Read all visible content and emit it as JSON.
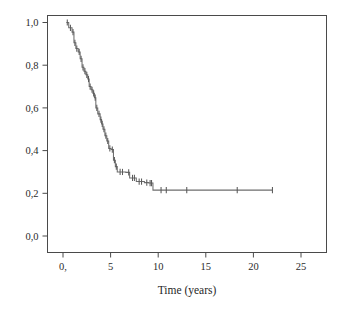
{
  "chart_data": {
    "type": "line",
    "subtype": "kaplan-meier-survival-step",
    "title": "",
    "subtitle": "",
    "xlabel": "Time (years)",
    "ylabel": "",
    "xlim": [
      -1.3,
      27.8
    ],
    "ylim": [
      -0.06,
      1.07
    ],
    "grid": false,
    "legend": null,
    "x_tick_labels": [
      "0,",
      "5",
      "10",
      "15",
      "20",
      "25"
    ],
    "x_tick_values": [
      0,
      5,
      10,
      15,
      20,
      25
    ],
    "y_tick_labels": [
      "0,0",
      "0,2",
      "0,4",
      "0,6",
      "0,8",
      "1,0"
    ],
    "y_tick_values": [
      0.0,
      0.2,
      0.4,
      0.6,
      0.8,
      1.0
    ],
    "line_color": "#6d6d6d",
    "frame_color": "#4a4a4a",
    "background_color": "#ffffff",
    "series": [
      {
        "name": "survival",
        "step_points": [
          [
            0.35,
            1.0
          ],
          [
            0.6,
            1.0
          ],
          [
            0.6,
            0.975
          ],
          [
            0.95,
            0.975
          ],
          [
            0.95,
            0.955
          ],
          [
            1.15,
            0.955
          ],
          [
            1.15,
            0.905
          ],
          [
            1.35,
            0.905
          ],
          [
            1.35,
            0.878
          ],
          [
            1.6,
            0.878
          ],
          [
            1.6,
            0.862
          ],
          [
            1.8,
            0.862
          ],
          [
            1.8,
            0.83
          ],
          [
            2.0,
            0.83
          ],
          [
            2.0,
            0.79
          ],
          [
            2.2,
            0.79
          ],
          [
            2.2,
            0.772
          ],
          [
            2.4,
            0.772
          ],
          [
            2.4,
            0.755
          ],
          [
            2.6,
            0.755
          ],
          [
            2.6,
            0.735
          ],
          [
            2.75,
            0.735
          ],
          [
            2.75,
            0.7
          ],
          [
            2.95,
            0.7
          ],
          [
            2.95,
            0.685
          ],
          [
            3.15,
            0.685
          ],
          [
            3.15,
            0.668
          ],
          [
            3.3,
            0.668
          ],
          [
            3.3,
            0.648
          ],
          [
            3.45,
            0.648
          ],
          [
            3.45,
            0.6
          ],
          [
            3.65,
            0.6
          ],
          [
            3.65,
            0.572
          ],
          [
            3.9,
            0.572
          ],
          [
            3.9,
            0.545
          ],
          [
            4.05,
            0.545
          ],
          [
            4.05,
            0.525
          ],
          [
            4.2,
            0.525
          ],
          [
            4.2,
            0.5
          ],
          [
            4.4,
            0.5
          ],
          [
            4.4,
            0.47
          ],
          [
            4.6,
            0.47
          ],
          [
            4.6,
            0.445
          ],
          [
            4.8,
            0.445
          ],
          [
            4.8,
            0.41
          ],
          [
            5.05,
            0.41
          ],
          [
            5.05,
            0.405
          ],
          [
            5.3,
            0.405
          ],
          [
            5.3,
            0.355
          ],
          [
            5.5,
            0.355
          ],
          [
            5.5,
            0.325
          ],
          [
            5.7,
            0.325
          ],
          [
            5.7,
            0.3
          ],
          [
            6.6,
            0.3
          ],
          [
            6.6,
            0.298
          ],
          [
            7.0,
            0.298
          ],
          [
            7.0,
            0.272
          ],
          [
            7.7,
            0.272
          ],
          [
            7.7,
            0.255
          ],
          [
            8.55,
            0.255
          ],
          [
            8.55,
            0.25
          ],
          [
            9.0,
            0.25
          ],
          [
            9.0,
            0.248
          ],
          [
            9.45,
            0.248
          ],
          [
            9.45,
            0.215
          ],
          [
            22.0,
            0.215
          ]
        ],
        "censored_points": [
          [
            0.45,
            1.0
          ],
          [
            0.78,
            0.975
          ],
          [
            1.05,
            0.955
          ],
          [
            1.25,
            0.905
          ],
          [
            1.45,
            0.878
          ],
          [
            1.7,
            0.862
          ],
          [
            1.9,
            0.83
          ],
          [
            2.1,
            0.79
          ],
          [
            2.3,
            0.772
          ],
          [
            2.5,
            0.755
          ],
          [
            2.68,
            0.735
          ],
          [
            2.85,
            0.7
          ],
          [
            3.05,
            0.685
          ],
          [
            3.22,
            0.668
          ],
          [
            3.38,
            0.648
          ],
          [
            3.55,
            0.6
          ],
          [
            3.78,
            0.572
          ],
          [
            3.98,
            0.545
          ],
          [
            4.12,
            0.525
          ],
          [
            4.3,
            0.5
          ],
          [
            4.5,
            0.47
          ],
          [
            4.7,
            0.445
          ],
          [
            4.92,
            0.41
          ],
          [
            5.18,
            0.405
          ],
          [
            5.4,
            0.355
          ],
          [
            5.6,
            0.325
          ],
          [
            6.0,
            0.3
          ],
          [
            6.25,
            0.3
          ],
          [
            6.9,
            0.298
          ],
          [
            7.3,
            0.272
          ],
          [
            7.5,
            0.272
          ],
          [
            8.0,
            0.255
          ],
          [
            8.25,
            0.255
          ],
          [
            8.8,
            0.25
          ],
          [
            9.15,
            0.248
          ],
          [
            9.3,
            0.248
          ],
          [
            10.3,
            0.215
          ],
          [
            10.85,
            0.215
          ],
          [
            13.0,
            0.215
          ],
          [
            18.3,
            0.215
          ],
          [
            22.0,
            0.215
          ]
        ]
      }
    ]
  },
  "figure": {
    "axis_title": "Time (years)",
    "alt_description": "Kaplan-Meier survival curve showing survival probability declining from 1,0 to about 0,2 over 22 years"
  }
}
